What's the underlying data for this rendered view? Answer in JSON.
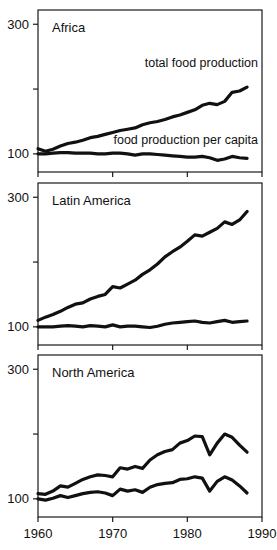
{
  "figure": {
    "width": 277,
    "height": 550,
    "background": "#ffffff",
    "line_color": "#111111",
    "frame_color": "#1a1a1a"
  },
  "axis": {
    "x_ticks": [
      "1960",
      "1970",
      "1980",
      "1990"
    ],
    "x_tick_values": [
      1960,
      1970,
      1980,
      1990
    ],
    "xlim": [
      1960,
      1990
    ],
    "y_ticks": [
      "100",
      "",
      "300"
    ],
    "y_tick_values": [
      100,
      200,
      300
    ],
    "y_labeled": [
      "100",
      "300"
    ],
    "ylim": [
      72,
      322
    ],
    "x_axis_labeled_on": "North America"
  },
  "series_labels": {
    "total": "total food production",
    "per_capita": "food production per capita"
  },
  "panels": [
    {
      "title": "Africa"
    },
    {
      "title": "Latin America"
    },
    {
      "title": "North America"
    }
  ],
  "chart_data": [
    {
      "type": "line",
      "title": "Africa",
      "xlabel": "",
      "ylabel": "",
      "xlim": [
        1960,
        1990
      ],
      "ylim": [
        72,
        322
      ],
      "grid": false,
      "legend": "inline-annotations",
      "x": [
        1960,
        1961,
        1962,
        1963,
        1964,
        1965,
        1966,
        1967,
        1968,
        1969,
        1970,
        1971,
        1972,
        1973,
        1974,
        1975,
        1976,
        1977,
        1978,
        1979,
        1980,
        1981,
        1982,
        1983,
        1984,
        1985,
        1986,
        1987,
        1988
      ],
      "series": [
        {
          "name": "total food production",
          "values": [
            108,
            104,
            107,
            112,
            116,
            118,
            121,
            125,
            127,
            130,
            133,
            136,
            138,
            140,
            145,
            148,
            150,
            153,
            157,
            160,
            164,
            168,
            175,
            178,
            176,
            181,
            195,
            197,
            203
          ]
        },
        {
          "name": "food production per capita",
          "values": [
            100,
            100,
            101,
            102,
            102,
            101,
            101,
            101,
            100,
            100,
            101,
            101,
            100,
            98,
            100,
            100,
            99,
            98,
            97,
            96,
            95,
            95,
            96,
            94,
            90,
            92,
            96,
            94,
            93
          ]
        }
      ]
    },
    {
      "type": "line",
      "title": "Latin America",
      "xlabel": "",
      "ylabel": "",
      "xlim": [
        1960,
        1990
      ],
      "ylim": [
        72,
        322
      ],
      "grid": false,
      "legend": "none",
      "x": [
        1960,
        1961,
        1962,
        1963,
        1964,
        1965,
        1966,
        1967,
        1968,
        1969,
        1970,
        1971,
        1972,
        1973,
        1974,
        1975,
        1976,
        1977,
        1978,
        1979,
        1980,
        1981,
        1982,
        1983,
        1984,
        1985,
        1986,
        1987,
        1988
      ],
      "series": [
        {
          "name": "total food production",
          "values": [
            110,
            115,
            119,
            124,
            130,
            135,
            137,
            143,
            147,
            150,
            162,
            160,
            166,
            172,
            181,
            188,
            197,
            208,
            216,
            223,
            232,
            242,
            240,
            246,
            252,
            262,
            258,
            265,
            278
          ]
        },
        {
          "name": "food production per capita",
          "values": [
            100,
            100,
            100,
            101,
            102,
            101,
            100,
            102,
            101,
            100,
            103,
            100,
            101,
            101,
            100,
            99,
            101,
            104,
            106,
            107,
            108,
            109,
            107,
            106,
            108,
            110,
            107,
            108,
            109
          ]
        }
      ]
    },
    {
      "type": "line",
      "title": "North America",
      "xlabel": "",
      "ylabel": "",
      "xlim": [
        1960,
        1990
      ],
      "ylim": [
        72,
        322
      ],
      "grid": false,
      "legend": "none",
      "x": [
        1960,
        1961,
        1962,
        1963,
        1964,
        1965,
        1966,
        1967,
        1968,
        1969,
        1970,
        1971,
        1972,
        1973,
        1974,
        1975,
        1976,
        1977,
        1978,
        1979,
        1980,
        1981,
        1982,
        1983,
        1984,
        1985,
        1986,
        1987,
        1988
      ],
      "series": [
        {
          "name": "total food production",
          "values": [
            108,
            107,
            112,
            120,
            118,
            124,
            130,
            134,
            137,
            136,
            134,
            148,
            146,
            150,
            147,
            160,
            168,
            173,
            176,
            186,
            190,
            197,
            196,
            168,
            186,
            200,
            195,
            183,
            172
          ]
        },
        {
          "name": "food production per capita",
          "values": [
            100,
            98,
            101,
            105,
            102,
            105,
            108,
            110,
            111,
            109,
            105,
            115,
            112,
            114,
            110,
            118,
            122,
            124,
            125,
            130,
            131,
            134,
            132,
            112,
            127,
            134,
            129,
            120,
            109
          ]
        }
      ]
    }
  ]
}
